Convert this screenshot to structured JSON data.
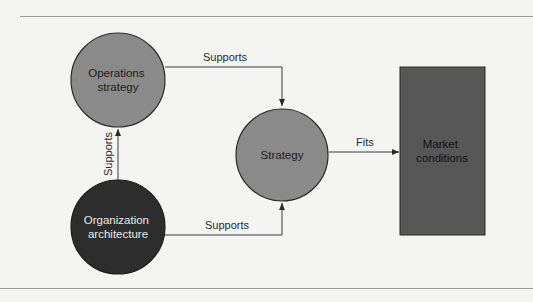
{
  "diagram": {
    "nodes": {
      "operations_strategy": {
        "lines": [
          "Operations",
          "strategy"
        ],
        "shape": "circle",
        "fill": "#8a8a8a",
        "text_color": "#1e1e1e"
      },
      "organization_architecture": {
        "lines": [
          "Organization",
          "architecture"
        ],
        "shape": "circle",
        "fill": "#2d2d2d",
        "text_color": "#e8e8e8"
      },
      "strategy": {
        "lines": [
          "Strategy"
        ],
        "shape": "circle",
        "fill": "#8a8a8a",
        "text_color": "#1e1e1e"
      },
      "market_conditions": {
        "lines": [
          "Market",
          "conditions"
        ],
        "shape": "rectangle",
        "fill": "#575757",
        "text_color": "#111111"
      }
    },
    "edges": [
      {
        "from": "operations_strategy",
        "to": "strategy",
        "label": "Supports"
      },
      {
        "from": "organization_architecture",
        "to": "operations_strategy",
        "label": "Supports"
      },
      {
        "from": "organization_architecture",
        "to": "strategy",
        "label": "Supports"
      },
      {
        "from": "strategy",
        "to": "market_conditions",
        "label": "Fits"
      }
    ],
    "colors": {
      "line": "#3a3a3a",
      "rule": "#9a9a9a",
      "background": "#f4f4f2"
    }
  }
}
